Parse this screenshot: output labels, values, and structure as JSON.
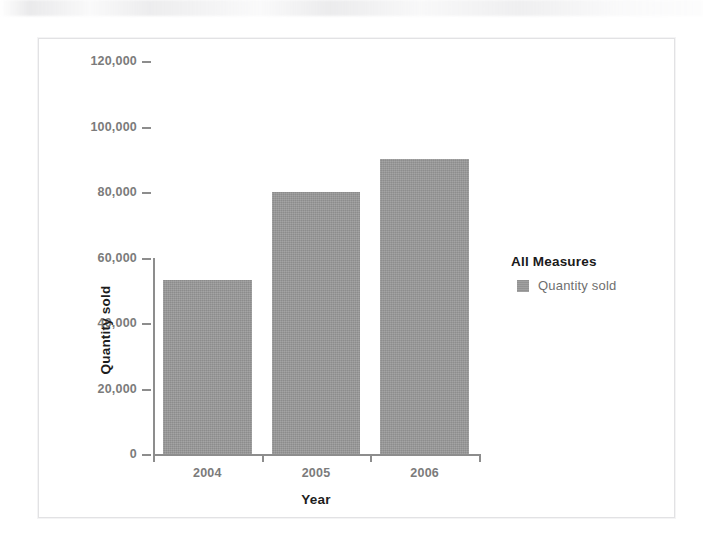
{
  "chart_data": {
    "type": "bar",
    "title": "",
    "categories": [
      "2004",
      "2005",
      "2006"
    ],
    "values": [
      53000,
      80000,
      90000
    ],
    "series": [
      {
        "name": "Quantity sold",
        "values": [
          53000,
          80000,
          90000
        ]
      }
    ],
    "xlabel": "Year",
    "ylabel": "Quantity sold",
    "ylim": [
      0,
      120000
    ],
    "ytick_values": [
      0,
      20000,
      40000,
      60000,
      80000,
      100000,
      120000
    ],
    "ytick_labels": [
      "0",
      "20,000",
      "40,000",
      "60,000",
      "80,000",
      "100,000",
      "120,000"
    ],
    "xtick_labels": [
      "2004",
      "2005",
      "2006"
    ],
    "grid": false,
    "legend_position": "right",
    "legend_title": "All Measures",
    "legend_entries": [
      {
        "label": "Quantity sold",
        "swatch": "legend-swatch-icon",
        "color": "#9a9a9a"
      }
    ],
    "colors": {
      "bar": "#9a9a9a",
      "axis": "#8d8d8d",
      "tick_label": "#7b7b7b",
      "axis_title": "#1d1d1d",
      "legend_title": "#1a1a1a",
      "legend_label": "#6f6f6f",
      "frame_border": "#e2e2e4",
      "background": "#ffffff"
    }
  }
}
